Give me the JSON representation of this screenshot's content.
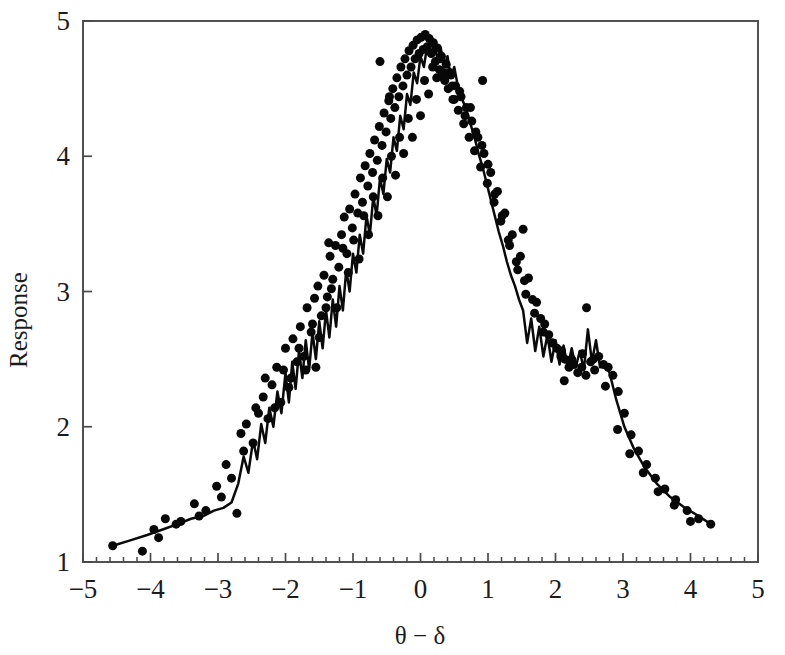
{
  "chart_data": {
    "type": "scatter",
    "title": "",
    "subtitle": "",
    "xlabel": "θ − δ",
    "ylabel": "Response",
    "xlim": [
      -5,
      5
    ],
    "ylim": [
      1,
      5
    ],
    "xticks": [
      -5,
      -4,
      -3,
      -2,
      -1,
      0,
      1,
      2,
      3,
      4,
      5
    ],
    "xtick_labels": [
      "−5",
      "−4",
      "−3",
      "−2",
      "−1",
      "0",
      "1",
      "2",
      "3",
      "4",
      "5"
    ],
    "yticks": [
      1,
      2,
      3,
      4,
      5
    ],
    "ytick_labels": [
      "1",
      "2",
      "3",
      "4",
      "5"
    ],
    "x_minor_tick_interval": 0.2,
    "grid": false,
    "legend": null,
    "marker": "filled-circle",
    "marker_color": "#080808",
    "marker_size": 9,
    "line_color": "#0a0a0a",
    "line_width": 2.5,
    "annotations": [],
    "series": [
      {
        "name": "Response scatter",
        "kind": "scatter",
        "x": [
          -4.56,
          -4.12,
          -3.95,
          -3.78,
          -3.55,
          -3.35,
          -3.18,
          -3.02,
          -2.88,
          -2.72,
          -2.66,
          -2.58,
          -2.48,
          -2.4,
          -2.33,
          -2.26,
          -2.2,
          -2.13,
          -2.07,
          -2.0,
          -1.95,
          -1.89,
          -1.83,
          -1.78,
          -1.73,
          -1.68,
          -1.62,
          -1.57,
          -1.52,
          -1.47,
          -1.43,
          -1.38,
          -1.34,
          -1.3,
          -1.26,
          -1.21,
          -1.17,
          -1.13,
          -1.09,
          -1.05,
          -1.01,
          -0.97,
          -0.93,
          -0.89,
          -0.86,
          -0.82,
          -0.78,
          -0.75,
          -0.71,
          -0.68,
          -0.64,
          -0.61,
          -0.57,
          -0.54,
          -0.51,
          -0.47,
          -0.44,
          -0.41,
          -0.38,
          -0.35,
          -0.32,
          -0.29,
          -0.26,
          -0.23,
          -0.2,
          -0.17,
          -0.14,
          -0.11,
          -0.08,
          -0.05,
          -0.02,
          0.01,
          0.04,
          0.07,
          0.1,
          0.13,
          0.16,
          0.19,
          0.22,
          0.25,
          0.28,
          0.31,
          0.34,
          0.38,
          0.41,
          0.45,
          0.48,
          0.52,
          0.56,
          0.6,
          0.64,
          0.68,
          0.72,
          0.76,
          0.8,
          0.85,
          0.89,
          0.94,
          0.99,
          1.04,
          1.09,
          1.14,
          1.19,
          1.25,
          1.3,
          1.36,
          1.42,
          1.48,
          1.54,
          1.6,
          1.66,
          1.72,
          1.78,
          1.84,
          1.9,
          1.96,
          2.02,
          2.08,
          2.14,
          2.2,
          2.27,
          2.33,
          2.39,
          2.45,
          2.52,
          2.58,
          2.64,
          2.71,
          2.78,
          2.85,
          2.93,
          3.02,
          3.12,
          3.23,
          3.35,
          3.48,
          3.62,
          3.78,
          3.95,
          4.12,
          4.3,
          -3.88,
          -3.62,
          -3.28,
          -2.95,
          -2.62,
          -2.44,
          -2.3,
          -2.16,
          -2.03,
          -1.92,
          -1.8,
          -1.7,
          -1.6,
          -1.5,
          -1.4,
          -1.32,
          -1.24,
          -1.15,
          -1.07,
          -0.99,
          -0.91,
          -0.84,
          -0.77,
          -0.7,
          -0.63,
          -0.56,
          -0.49,
          -0.43,
          -0.37,
          -0.31,
          -0.25,
          -0.18,
          -0.12,
          -0.06,
          0.0,
          0.06,
          0.12,
          0.18,
          0.24,
          0.3,
          0.36,
          0.43,
          0.5,
          0.58,
          0.66,
          0.74,
          0.82,
          0.91,
          1.0,
          1.1,
          1.21,
          1.32,
          1.44,
          1.56,
          1.69,
          1.82,
          1.95,
          2.09,
          2.24,
          2.4,
          2.56,
          2.74,
          2.92,
          3.1,
          3.3,
          3.52,
          3.76,
          4.0,
          -2.8,
          -1.36,
          -0.6,
          0.33,
          0.92,
          1.52,
          2.13,
          2.46,
          -1.55,
          -0.46,
          0.47
        ],
        "y": [
          1.12,
          1.08,
          1.24,
          1.32,
          1.3,
          1.43,
          1.38,
          1.56,
          1.72,
          1.36,
          1.95,
          2.02,
          1.88,
          2.1,
          2.22,
          2.06,
          2.31,
          2.44,
          2.18,
          2.58,
          2.29,
          2.65,
          2.48,
          2.74,
          2.52,
          2.88,
          2.7,
          2.95,
          3.04,
          2.82,
          3.12,
          2.96,
          3.26,
          3.09,
          3.34,
          3.18,
          3.42,
          3.55,
          3.28,
          3.61,
          3.47,
          3.72,
          3.58,
          3.84,
          3.66,
          3.93,
          3.78,
          4.02,
          3.88,
          4.12,
          3.97,
          4.22,
          4.08,
          4.32,
          4.18,
          4.41,
          4.28,
          4.5,
          4.36,
          4.58,
          4.44,
          4.66,
          4.52,
          4.72,
          4.6,
          4.78,
          4.66,
          4.82,
          4.72,
          4.86,
          4.76,
          4.88,
          4.79,
          4.9,
          4.81,
          4.87,
          4.76,
          4.84,
          4.7,
          4.8,
          4.64,
          4.74,
          4.58,
          4.68,
          4.5,
          4.6,
          4.42,
          4.52,
          4.34,
          4.44,
          4.24,
          4.36,
          4.14,
          4.26,
          4.04,
          4.14,
          3.92,
          4.02,
          3.8,
          3.88,
          3.66,
          3.74,
          3.52,
          3.58,
          3.38,
          3.42,
          3.22,
          3.26,
          3.08,
          3.1,
          2.94,
          2.92,
          2.8,
          2.76,
          2.68,
          2.62,
          2.58,
          2.52,
          2.5,
          2.44,
          2.46,
          2.4,
          2.44,
          2.38,
          2.48,
          2.42,
          2.52,
          2.46,
          2.44,
          2.38,
          2.26,
          2.1,
          1.94,
          1.82,
          1.72,
          1.62,
          1.54,
          1.46,
          1.38,
          1.32,
          1.28,
          1.18,
          1.28,
          1.34,
          1.48,
          1.82,
          2.14,
          2.36,
          2.14,
          2.42,
          2.36,
          2.58,
          2.42,
          2.76,
          2.66,
          2.88,
          3.02,
          2.88,
          3.32,
          3.14,
          3.38,
          3.24,
          3.56,
          3.42,
          3.7,
          3.56,
          3.84,
          3.7,
          4.0,
          3.86,
          4.14,
          4.02,
          4.28,
          4.14,
          4.42,
          4.3,
          4.56,
          4.46,
          4.66,
          4.58,
          4.72,
          4.56,
          4.62,
          4.42,
          4.48,
          4.3,
          4.36,
          4.18,
          4.08,
          3.94,
          3.72,
          3.56,
          3.34,
          3.16,
          2.98,
          2.84,
          2.7,
          2.62,
          2.56,
          2.5,
          2.54,
          2.5,
          2.3,
          1.98,
          1.8,
          1.66,
          1.52,
          1.42,
          1.3,
          1.62,
          3.36,
          4.7,
          4.62,
          4.56,
          3.46,
          2.34,
          2.88,
          2.44,
          4.44,
          4.52
        ]
      },
      {
        "name": "Response smoothed line",
        "kind": "line",
        "x": [
          -4.56,
          -4.3,
          -4.05,
          -3.82,
          -3.6,
          -3.4,
          -3.22,
          -3.06,
          -2.92,
          -2.8,
          -2.7,
          -2.62,
          -2.55,
          -2.48,
          -2.42,
          -2.36,
          -2.3,
          -2.24,
          -2.18,
          -2.12,
          -2.06,
          -2.0,
          -1.95,
          -1.9,
          -1.85,
          -1.8,
          -1.75,
          -1.7,
          -1.65,
          -1.6,
          -1.55,
          -1.5,
          -1.45,
          -1.4,
          -1.35,
          -1.3,
          -1.25,
          -1.2,
          -1.15,
          -1.1,
          -1.05,
          -1.0,
          -0.95,
          -0.9,
          -0.85,
          -0.8,
          -0.75,
          -0.7,
          -0.65,
          -0.6,
          -0.55,
          -0.5,
          -0.45,
          -0.4,
          -0.35,
          -0.3,
          -0.25,
          -0.2,
          -0.15,
          -0.1,
          -0.05,
          0.0,
          0.05,
          0.1,
          0.15,
          0.2,
          0.25,
          0.3,
          0.35,
          0.4,
          0.45,
          0.5,
          0.56,
          0.62,
          0.68,
          0.74,
          0.8,
          0.86,
          0.92,
          0.98,
          1.04,
          1.1,
          1.16,
          1.22,
          1.28,
          1.34,
          1.4,
          1.46,
          1.52,
          1.58,
          1.64,
          1.7,
          1.76,
          1.82,
          1.88,
          1.94,
          2.0,
          2.06,
          2.12,
          2.18,
          2.24,
          2.3,
          2.36,
          2.42,
          2.48,
          2.54,
          2.6,
          2.66,
          2.72,
          2.8,
          2.9,
          3.02,
          3.16,
          3.32,
          3.5,
          3.7,
          3.92,
          4.12,
          4.3
        ],
        "y": [
          1.12,
          1.16,
          1.2,
          1.24,
          1.28,
          1.32,
          1.34,
          1.38,
          1.4,
          1.44,
          1.58,
          1.78,
          1.66,
          1.9,
          1.76,
          2.02,
          1.88,
          2.14,
          2.0,
          2.26,
          2.1,
          2.4,
          2.18,
          2.48,
          2.28,
          2.56,
          2.36,
          2.64,
          2.42,
          2.7,
          2.5,
          2.78,
          2.58,
          2.86,
          2.66,
          2.94,
          2.74,
          3.04,
          2.86,
          3.16,
          3.0,
          3.28,
          3.14,
          3.42,
          3.28,
          3.56,
          3.42,
          3.7,
          3.56,
          3.84,
          3.72,
          3.98,
          3.88,
          4.14,
          4.04,
          4.3,
          4.2,
          4.46,
          4.38,
          4.62,
          4.54,
          4.74,
          4.66,
          4.82,
          4.74,
          4.84,
          4.72,
          4.8,
          4.66,
          4.74,
          4.58,
          4.66,
          4.5,
          4.42,
          4.34,
          4.24,
          4.14,
          4.02,
          3.92,
          3.8,
          3.68,
          3.56,
          3.44,
          3.34,
          3.22,
          3.12,
          3.04,
          2.94,
          2.86,
          2.62,
          2.8,
          2.56,
          2.74,
          2.52,
          2.68,
          2.48,
          2.64,
          2.46,
          2.6,
          2.44,
          2.58,
          2.44,
          2.56,
          2.42,
          2.72,
          2.48,
          2.64,
          2.44,
          2.46,
          2.4,
          2.2,
          2.0,
          1.84,
          1.7,
          1.58,
          1.48,
          1.4,
          1.34,
          1.28
        ]
      }
    ]
  },
  "axes": {
    "x_label": "θ − δ",
    "y_label": "Response"
  }
}
